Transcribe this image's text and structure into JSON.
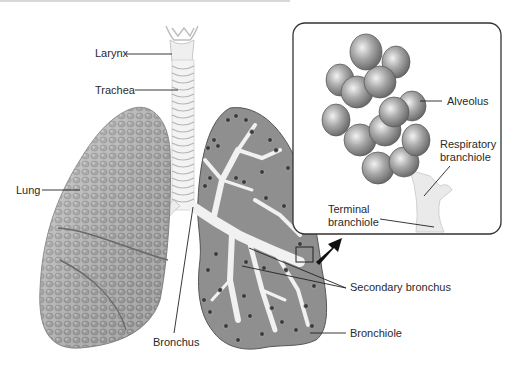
{
  "figure": {
    "type": "anatomical illustration"
  },
  "labels": {
    "larynx": "Larynx",
    "trachea": "Trachea",
    "lung": "Lung",
    "bronchus": "Bronchus",
    "alveolus": "Alveolus",
    "respiratory_branchiole_line1": "Respiratory",
    "respiratory_branchiole_line2": "branchiole",
    "terminal_branchiole_line1": "Terminal",
    "terminal_branchiole_line2": "branchiole",
    "secondary_bronchus": "Secondary bronchus",
    "bronchiole": "Bronchiole"
  },
  "colors": {
    "background": "#ffffff",
    "outline": "#333333",
    "lung_fill": "#b9b9b9",
    "lung_cut_fill": "#8e8e8e",
    "airway_fill": "#ececec",
    "alveolus_fill": "#9a9a9a",
    "label_text": "#2a2a2a",
    "leader_line": "#222222"
  },
  "inset": {
    "description": "Magnified view of alveolar cluster",
    "shape": "rounded-rectangle"
  }
}
